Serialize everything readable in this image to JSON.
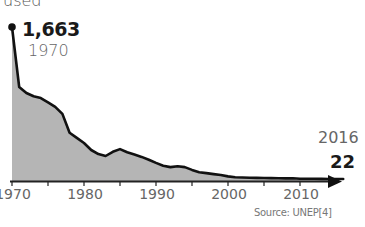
{
  "chart_data": {
    "type": "area",
    "title": "",
    "ylabel_fragment": "used",
    "xlabel": "",
    "ylabel": "",
    "x": [
      1970,
      1971,
      1972,
      1973,
      1974,
      1975,
      1976,
      1977,
      1978,
      1979,
      1980,
      1981,
      1982,
      1983,
      1984,
      1985,
      1986,
      1987,
      1988,
      1989,
      1990,
      1991,
      1992,
      1993,
      1994,
      1995,
      1996,
      1997,
      1998,
      1999,
      2000,
      2001,
      2002,
      2003,
      2004,
      2005,
      2006,
      2007,
      2008,
      2009,
      2010,
      2011,
      2012,
      2013,
      2014,
      2015,
      2016
    ],
    "series": [
      {
        "name": "used",
        "values": [
          1663,
          1015,
          950,
          915,
          895,
          850,
          800,
          725,
          520,
          465,
          410,
          335,
          290,
          270,
          315,
          345,
          310,
          285,
          260,
          230,
          195,
          165,
          150,
          160,
          150,
          120,
          95,
          85,
          75,
          65,
          50,
          40,
          38,
          35,
          33,
          32,
          31,
          30,
          28,
          30,
          25,
          24,
          24,
          23,
          22,
          22,
          22
        ]
      }
    ],
    "xticks": [
      "1970",
      "1980",
      "1990",
      "2000",
      "2010"
    ],
    "xlim": [
      1970,
      2016
    ],
    "ylim": [
      0,
      1663
    ],
    "grid": false,
    "legend": null,
    "annotations": [
      {
        "label": "1,663",
        "sublabel": "1970"
      },
      {
        "label": "22",
        "sublabel": "2016"
      }
    ],
    "source": "Source: UNEP[4]"
  },
  "labels": {
    "used": "used",
    "start_value": "1,663",
    "start_year": "1970",
    "end_year": "2016",
    "end_value": "22",
    "source": "Source: UNEP[4]",
    "ticks": [
      "1970",
      "1980",
      "1990",
      "2000",
      "2010"
    ]
  },
  "colors": {
    "fill": "#b5b5b5",
    "line": "#111111",
    "axis": "#222222",
    "text": "#666666"
  }
}
